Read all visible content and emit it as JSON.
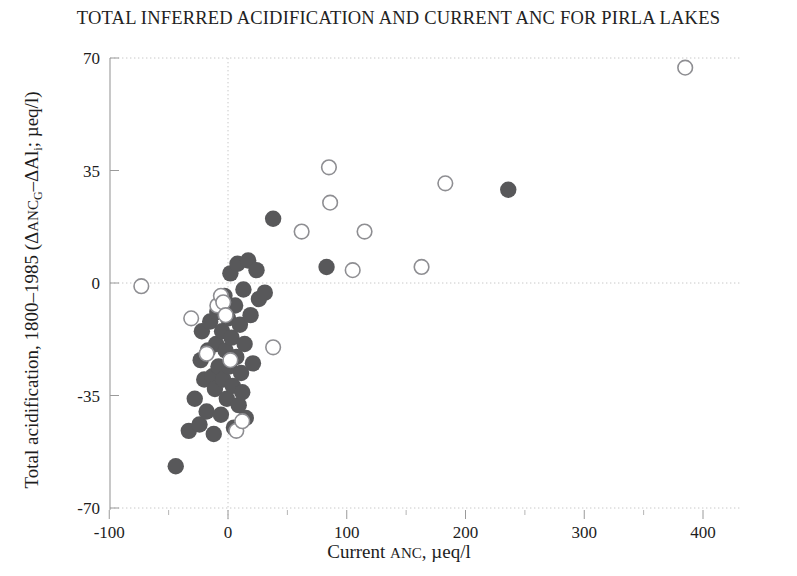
{
  "chart_data": {
    "type": "scatter",
    "title": "TOTAL INFERRED ACIDIFICATION AND CURRENT ANC FOR PIRLA LAKES",
    "xlabel_parts": {
      "lead": "Current ",
      "smallcaps": "ANC",
      "tail": ", µeq/l"
    },
    "xlabel": "Current ANC, µeq/l",
    "ylabel": "Total acidification, 1800–1985  (ΔANCₒ–ΔAlᵢ; µeq/l)",
    "ylabel_parts": {
      "lead": "Total acidification, 1800–1985  (Δ",
      "sc1": "ANC",
      "sub1": "G",
      "mid": "–ΔAl",
      "sub2": "i",
      "tail": "; µeq/l)"
    },
    "xlim": [
      -110,
      420
    ],
    "ylim": [
      -72,
      72
    ],
    "xticks": [
      -100,
      0,
      100,
      200,
      300,
      400
    ],
    "xticklabels": [
      "-100",
      "0",
      "100",
      "200",
      "300",
      "400"
    ],
    "xminorticks": [
      -50,
      50,
      150,
      250,
      350
    ],
    "yticks": [
      -70,
      -35,
      0,
      35,
      70
    ],
    "yticklabels": [
      "-70",
      "-35",
      "0",
      "35",
      "70"
    ],
    "grid": true,
    "gridlines_x": [
      0
    ],
    "gridlines_y": [
      -70,
      0,
      70
    ],
    "legend": null,
    "marker_colors": {
      "filled": "#58585a",
      "open_stroke": "#8e8e92",
      "open_fill": "#ffffff"
    },
    "series": [
      {
        "name": "filled",
        "style": "filled-circle",
        "points": [
          [
            -44,
            -57
          ],
          [
            -33,
            -46
          ],
          [
            -28,
            -36
          ],
          [
            -24,
            -44
          ],
          [
            -23,
            -24
          ],
          [
            -22,
            -15
          ],
          [
            -20,
            -30
          ],
          [
            -18,
            -40
          ],
          [
            -17,
            -21
          ],
          [
            -15,
            -12
          ],
          [
            -13,
            -29
          ],
          [
            -12,
            -47
          ],
          [
            -11,
            -33
          ],
          [
            -10,
            -19
          ],
          [
            -9,
            -9
          ],
          [
            -8,
            -26
          ],
          [
            -6,
            -41
          ],
          [
            -5,
            -15
          ],
          [
            -4,
            -30
          ],
          [
            -3,
            -4
          ],
          [
            -2,
            -21
          ],
          [
            -1,
            -36
          ],
          [
            0,
            -11
          ],
          [
            1,
            -26
          ],
          [
            2,
            3
          ],
          [
            3,
            -17
          ],
          [
            4,
            -32
          ],
          [
            5,
            -45
          ],
          [
            6,
            -7
          ],
          [
            7,
            -23
          ],
          [
            8,
            6
          ],
          [
            9,
            -38
          ],
          [
            10,
            -13
          ],
          [
            11,
            -28
          ],
          [
            12,
            -34
          ],
          [
            13,
            -2
          ],
          [
            14,
            -19
          ],
          [
            15,
            -42
          ],
          [
            17,
            7
          ],
          [
            19,
            -10
          ],
          [
            21,
            -25
          ],
          [
            24,
            4
          ],
          [
            26,
            -5
          ],
          [
            31,
            -3
          ],
          [
            38,
            20
          ],
          [
            83,
            5
          ],
          [
            236,
            29
          ]
        ]
      },
      {
        "name": "open",
        "style": "open-circle",
        "points": [
          [
            -73,
            -1
          ],
          [
            -31,
            -11
          ],
          [
            -18,
            -22
          ],
          [
            -9,
            -7
          ],
          [
            -6,
            -4
          ],
          [
            -4,
            -6
          ],
          [
            -2,
            -10
          ],
          [
            2,
            -24
          ],
          [
            7,
            -46
          ],
          [
            12,
            -43
          ],
          [
            38,
            -20
          ],
          [
            62,
            16
          ],
          [
            85,
            36
          ],
          [
            86,
            25
          ],
          [
            105,
            4
          ],
          [
            115,
            16
          ],
          [
            163,
            5
          ],
          [
            183,
            31
          ],
          [
            385,
            67
          ]
        ]
      }
    ]
  }
}
